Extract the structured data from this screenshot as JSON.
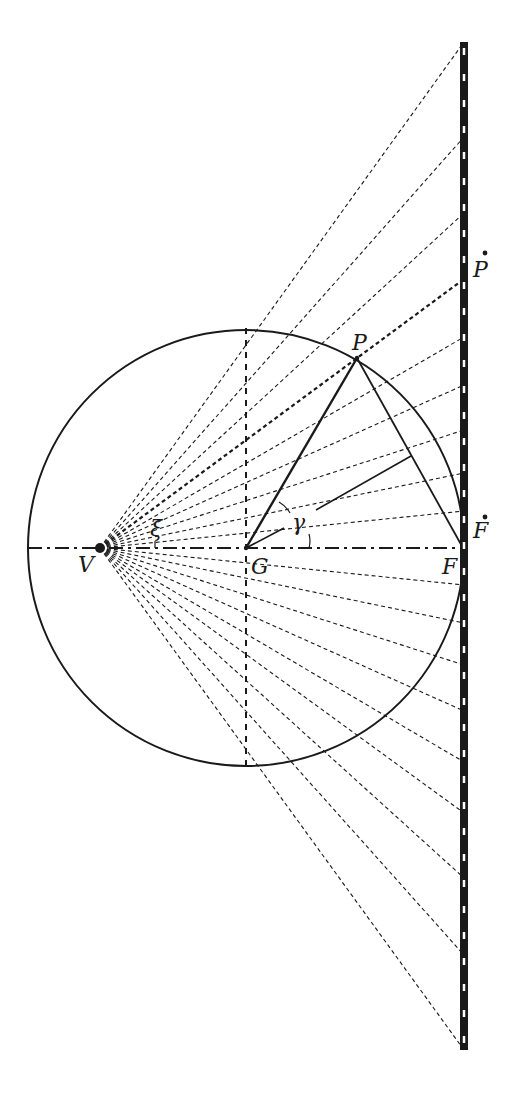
{
  "diagram": {
    "type": "geometric-optics-construction",
    "colors": {
      "ink": "#1a1a1a",
      "background": "#ffffff"
    },
    "points": {
      "V": {
        "label": "V",
        "x": 100,
        "y": 548
      },
      "G": {
        "label": "G",
        "x": 246,
        "y": 548
      },
      "F": {
        "label": "F",
        "x": 463,
        "y": 548
      },
      "P": {
        "label": "P",
        "x": 357,
        "y": 358
      },
      "F_dot": {
        "label": "F",
        "x": 464,
        "y": 548
      },
      "P_dot": {
        "label": "P",
        "x": 464,
        "y": 279
      }
    },
    "angles": {
      "xi": {
        "label": "ξ"
      },
      "gamma": {
        "label": "γ"
      }
    },
    "circle": {
      "cx": 246,
      "cy": 548,
      "r": 218
    },
    "screen": {
      "x": 464,
      "y_top": 42,
      "y_bottom": 1050
    },
    "ray_screen_hits_y": [
      42,
      137,
      213,
      279,
      337,
      385,
      430,
      473,
      511,
      585,
      623,
      665,
      711,
      762,
      813,
      878,
      955,
      1050
    ],
    "highlighted_ray_y": 279
  }
}
